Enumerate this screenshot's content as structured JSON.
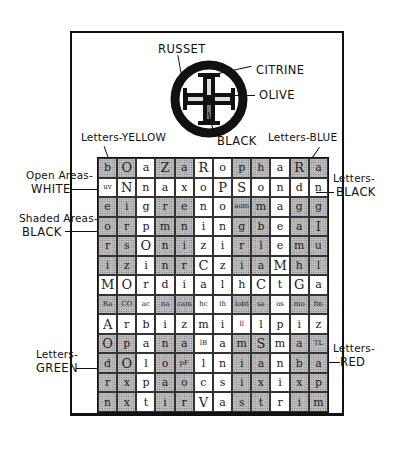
{
  "emblem": {
    "labels": {
      "russet": "RUSSET",
      "citrine": "CITRINE",
      "olive": "OLIVE",
      "black": "BLACK"
    }
  },
  "labels": {
    "letters_yellow": "Letters-YELLOW",
    "letters_blue": "Letters-BLUE",
    "open_areas": "Open Areas-",
    "white": "WHITE",
    "shaded_areas": "Shaded Areas-",
    "black_left": "BLACK",
    "letters_black_top": "Letters-",
    "letters_black_bottom": "BLACK",
    "letters_green_top": "Letters-",
    "letters_green_bottom": "GREEN",
    "letters_red_top": "Letters-",
    "letters_red_bottom": "RED"
  },
  "grid": {
    "columns": 12,
    "rows": [
      {
        "cells": [
          "b",
          "O",
          "a",
          "Z",
          "a",
          "R",
          "o",
          "p",
          "h",
          "a",
          "R",
          "a"
        ],
        "shade": [
          1,
          1,
          0,
          1,
          1,
          0,
          0,
          1,
          1,
          0,
          1,
          1
        ]
      },
      {
        "cells": [
          "uv",
          "N",
          "n",
          "a",
          "x",
          "o",
          "P",
          "S",
          "o",
          "n",
          "d",
          "n"
        ],
        "shade": [
          0,
          0,
          0,
          0,
          0,
          0,
          0,
          0,
          0,
          0,
          0,
          0
        ]
      },
      {
        "cells": [
          "e",
          "i",
          "g",
          "r",
          "e",
          "n",
          "o",
          "aom",
          "m",
          "a",
          "g",
          "g"
        ],
        "shade": [
          1,
          1,
          0,
          1,
          1,
          0,
          0,
          1,
          1,
          0,
          1,
          1
        ]
      },
      {
        "cells": [
          "o",
          "r",
          "p",
          "m",
          "n",
          "i",
          "n",
          "g",
          "b",
          "e",
          "a",
          "I"
        ],
        "shade": [
          1,
          1,
          0,
          1,
          1,
          0,
          0,
          1,
          1,
          0,
          1,
          1
        ]
      },
      {
        "cells": [
          "r",
          "s",
          "O",
          "n",
          "i",
          "z",
          "i",
          "r",
          "l",
          "e",
          "m",
          "u"
        ],
        "shade": [
          1,
          1,
          0,
          1,
          1,
          0,
          0,
          1,
          1,
          0,
          1,
          1
        ]
      },
      {
        "cells": [
          "i",
          "z",
          "i",
          "n",
          "r",
          "C",
          "z",
          "i",
          "a",
          "M",
          "h",
          "l"
        ],
        "shade": [
          1,
          1,
          0,
          1,
          1,
          0,
          0,
          1,
          1,
          0,
          1,
          1
        ]
      },
      {
        "cells": [
          "M",
          "O",
          "r",
          "d",
          "i",
          "a",
          "l",
          "h",
          "C",
          "t",
          "G",
          "a"
        ],
        "shade": [
          0,
          0,
          0,
          0,
          0,
          0,
          0,
          0,
          0,
          0,
          0,
          0
        ]
      },
      {
        "cells": [
          "Ra",
          "CO",
          "ac",
          "na",
          "cam",
          "hc",
          "ih",
          "lobt",
          "sa",
          "os",
          "mo",
          "fm"
        ],
        "shade": [
          1,
          1,
          0,
          1,
          1,
          0,
          0,
          1,
          1,
          0,
          1,
          1
        ]
      },
      {
        "cells": [
          "A",
          "r",
          "b",
          "i",
          "z",
          "m",
          "i",
          "ll",
          "l",
          "p",
          "i",
          "z"
        ],
        "shade": [
          0,
          0,
          0,
          0,
          0,
          0,
          0,
          0,
          0,
          0,
          0,
          0
        ]
      },
      {
        "cells": [
          "O",
          "p",
          "a",
          "n",
          "a",
          "lB",
          "a",
          "m",
          "S",
          "m",
          "a",
          "TL"
        ],
        "shade": [
          1,
          1,
          0,
          1,
          1,
          0,
          0,
          1,
          1,
          0,
          1,
          1
        ]
      },
      {
        "cells": [
          "d",
          "O",
          "l",
          "o",
          "pF",
          "l",
          "n",
          "i",
          "a",
          "n",
          "b",
          "a"
        ],
        "shade": [
          1,
          1,
          0,
          1,
          1,
          0,
          0,
          1,
          1,
          0,
          1,
          1
        ]
      },
      {
        "cells": [
          "r",
          "x",
          "p",
          "a",
          "o",
          "c",
          "s",
          "i",
          "x",
          "i",
          "x",
          "p"
        ],
        "shade": [
          1,
          1,
          0,
          1,
          1,
          0,
          0,
          1,
          1,
          0,
          1,
          1
        ]
      },
      {
        "cells": [
          "n",
          "x",
          "t",
          "i",
          "r",
          "V",
          "a",
          "s",
          "t",
          "r",
          "i",
          "m"
        ],
        "shade": [
          1,
          1,
          0,
          1,
          1,
          0,
          0,
          1,
          1,
          0,
          1,
          1
        ]
      }
    ]
  }
}
